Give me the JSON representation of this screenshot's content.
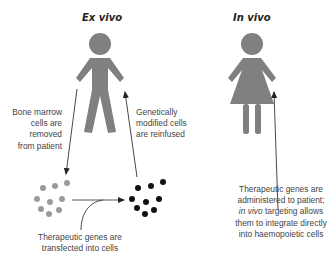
{
  "diagram": {
    "ex_vivo": {
      "title": "Ex vivo",
      "figure": "male-person-icon",
      "labels": {
        "removed": [
          "Bone marrow",
          "cells are",
          "removed",
          "from patient"
        ],
        "reinfused": [
          "Genetically",
          "modified cells",
          "are reinfused"
        ],
        "transfected": [
          "Therapeutic genes are",
          "transfected into cells"
        ]
      }
    },
    "in_vivo": {
      "title": "In vivo",
      "figure": "female-person-icon",
      "labels": {
        "administered_line1": "Therapeutic genes are",
        "administered_line2": "administered to patient;",
        "administered_line3_italic": "in vivo",
        "administered_line3_rest": " targeting allows",
        "administered_line4": "them to integrate directly",
        "administered_line5": "into haemopoietic cells"
      }
    },
    "colors": {
      "figure": "#808080",
      "untreated_cells": "#9a9a9a",
      "modified_cells": "#111111",
      "arrow": "#333333",
      "text": "#444444"
    }
  }
}
